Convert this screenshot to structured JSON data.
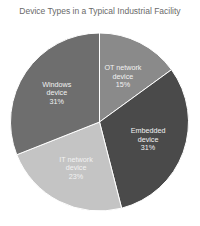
{
  "chart_data": {
    "type": "pie",
    "title": "Device Types in a Typical Industrial Facility",
    "start_angle": "12 o'clock, clockwise",
    "slices": [
      {
        "label_line1": "OT network",
        "label_line2": "device",
        "pct_label": "15%",
        "value": 15,
        "color": "#8a8a8a"
      },
      {
        "label_line1": "Embedded",
        "label_line2": "device",
        "pct_label": "31%",
        "value": 31,
        "color": "#4a4a4a"
      },
      {
        "label_line1": "IT network",
        "label_line2": "device",
        "pct_label": "23%",
        "value": 23,
        "color": "#c4c4c4"
      },
      {
        "label_line1": "Windows",
        "label_line2": "device",
        "pct_label": "31%",
        "value": 31,
        "color": "#6e6e6e"
      }
    ],
    "legend": "none (inline labels)"
  }
}
